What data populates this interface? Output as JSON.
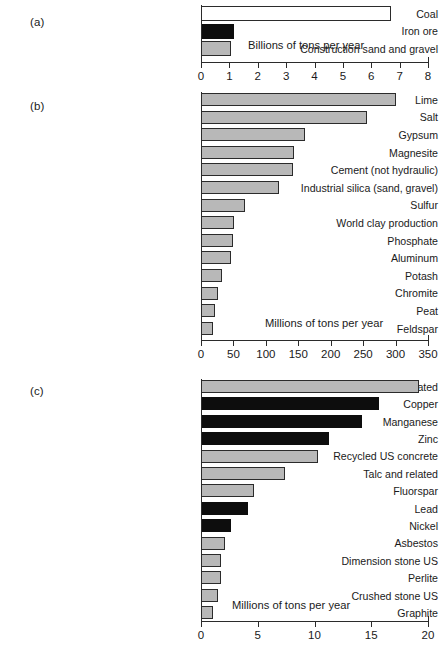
{
  "figure": {
    "background": "#ffffff",
    "bar_colors": {
      "grey": "#b8b8b8",
      "black": "#0d0d0d",
      "white": "#ffffff",
      "outline": "#2b2b2b"
    }
  },
  "panels": [
    {
      "tag": "(a)",
      "annotation": "Billions of tons per year",
      "axis_label": "Billions of tons per year",
      "ticks": [
        "0",
        "1",
        "2",
        "3",
        "4",
        "5",
        "6",
        "7",
        "8"
      ],
      "categories": [
        "Coal",
        "Iron ore",
        "Construction sand and gravel"
      ]
    },
    {
      "tag": "(b)",
      "annotation": "Millions of tons per year",
      "axis_label": "Millions of tons per year",
      "ticks": [
        "0",
        "50",
        "100",
        "150",
        "200",
        "250",
        "300",
        "350"
      ],
      "categories": [
        "Lime",
        "Salt",
        "Gypsum",
        "Magnesite",
        "Cement (not hydraulic)",
        "Industrial silica (sand, gravel)",
        "Sulfur",
        "World clay production",
        "Phosphate",
        "Aluminum",
        "Potash",
        "Chromite",
        "Peat",
        "Feldspar"
      ]
    },
    {
      "tag": "(c)",
      "annotation": "Millions of tons per year",
      "axis_label": "Millions of tons per year",
      "ticks": [
        "0",
        "5",
        "10",
        "15",
        "20"
      ],
      "categories": [
        "Pumice and related",
        "Copper",
        "Manganese",
        "Zinc",
        "Recycled US concrete",
        "Talc and related",
        "Fluorspar",
        "Lead",
        "Nickel",
        "Asbestos",
        "Dimension stone US",
        "Perlite",
        "Crushed stone US",
        "Graphite"
      ]
    }
  ],
  "chart_data": [
    {
      "type": "bar",
      "orientation": "horizontal",
      "panel": "(a)",
      "title": "",
      "xlabel": "Billions of tons per year",
      "ylabel": "",
      "xlim": [
        0,
        8
      ],
      "xticks": [
        0,
        1,
        2,
        3,
        4,
        5,
        6,
        7,
        8
      ],
      "grid": false,
      "legend": "none",
      "categories": [
        "Coal",
        "Iron ore",
        "Construction sand and gravel"
      ],
      "values": [
        6.7,
        1.15,
        1.05
      ],
      "fills": [
        "white",
        "black",
        "grey"
      ],
      "annotation": "Billions of tons per year"
    },
    {
      "type": "bar",
      "orientation": "horizontal",
      "panel": "(b)",
      "title": "",
      "xlabel": "Millions of tons per year",
      "ylabel": "",
      "xlim": [
        0,
        350
      ],
      "xticks": [
        0,
        50,
        100,
        150,
        200,
        250,
        300,
        350
      ],
      "grid": false,
      "legend": "none",
      "categories": [
        "Lime",
        "Salt",
        "Gypsum",
        "Magnesite",
        "Cement (not hydraulic)",
        "Industrial silica (sand, gravel)",
        "Sulfur",
        "World clay production",
        "Phosphate",
        "Aluminum",
        "Potash",
        "Chromite",
        "Peat",
        "Feldspar"
      ],
      "values": [
        300,
        256,
        160,
        143,
        142,
        121,
        68,
        51,
        50,
        47,
        33,
        26,
        22,
        19
      ],
      "fills": [
        "grey",
        "grey",
        "grey",
        "grey",
        "grey",
        "grey",
        "grey",
        "grey",
        "grey",
        "grey",
        "grey",
        "grey",
        "grey",
        "grey"
      ],
      "annotation": "Millions of tons per year"
    },
    {
      "type": "bar",
      "orientation": "horizontal",
      "panel": "(c)",
      "title": "",
      "xlabel": "Millions of tons per year",
      "ylabel": "",
      "xlim": [
        0,
        20
      ],
      "xticks": [
        0,
        5,
        10,
        15,
        20
      ],
      "grid": false,
      "legend": "none",
      "categories": [
        "Pumice and related",
        "Copper",
        "Manganese",
        "Zinc",
        "Recycled US concrete",
        "Talc and related",
        "Fluorspar",
        "Lead",
        "Nickel",
        "Asbestos",
        "Dimension stone US",
        "Perlite",
        "Crushed stone US",
        "Graphite"
      ],
      "values": [
        19.2,
        15.7,
        14.2,
        11.3,
        10.3,
        7.4,
        4.7,
        4.1,
        2.6,
        2.1,
        1.8,
        1.8,
        1.5,
        1.1
      ],
      "fills": [
        "grey",
        "black",
        "black",
        "black",
        "grey",
        "grey",
        "grey",
        "black",
        "black",
        "grey",
        "grey",
        "grey",
        "grey",
        "grey"
      ],
      "annotation": "Millions of tons per year"
    }
  ]
}
